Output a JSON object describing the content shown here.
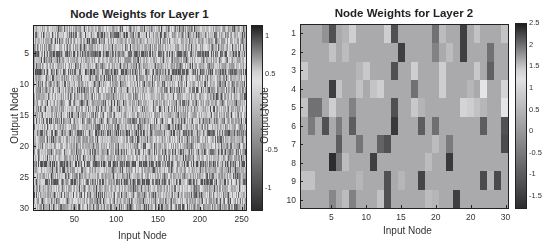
{
  "chart_data": [
    {
      "type": "heatmap",
      "title": "Node Weights for Layer 1",
      "xlabel": "Input Node",
      "ylabel": "Output Node",
      "x_range": [
        1,
        256
      ],
      "y_range": [
        1,
        30
      ],
      "xticks": [
        50,
        100,
        150,
        200,
        250
      ],
      "yticks": [
        5,
        10,
        15,
        20,
        25,
        30
      ],
      "colorbar": {
        "ticks": [
          1,
          0.5,
          0,
          -0.5,
          -1
        ],
        "range": [
          -1.3,
          1.15
        ],
        "colormap": "gray-tinted (dark = high/low extremes, light = ~0.5)"
      },
      "rows": 30,
      "cols": 256,
      "row_character": {
        "dark_rows": [
          5,
          8,
          18,
          23,
          26
        ],
        "medium_rows": [
          2,
          11,
          14,
          16,
          21,
          28,
          30
        ],
        "note": "Individual 30x256 weights not legible; rows 5 and 23 show strong dark banding, rows 8, 18, 26 moderate banding."
      }
    },
    {
      "type": "heatmap",
      "title": "Node Weights for Layer 2",
      "xlabel": "Input Node",
      "ylabel": "Output Node",
      "x_range": [
        1,
        30
      ],
      "y_range": [
        1,
        10
      ],
      "xticks": [
        "5",
        "10",
        "15",
        "20",
        "20",
        "30"
      ],
      "yticks": [
        1,
        2,
        3,
        4,
        5,
        6,
        7,
        8,
        9,
        10
      ],
      "colorbar": {
        "ticks": [
          2.5,
          2,
          1.5,
          1,
          0.5,
          0,
          -0.5,
          -1,
          -1.5
        ],
        "range": [
          -1.8,
          2.5
        ]
      },
      "rows": 10,
      "cols": 30,
      "values": [
        [
          0.3,
          0.3,
          0.3,
          1.8,
          2.2,
          0.3,
          1.6,
          0.9,
          0.3,
          0.3,
          0.3,
          0.3,
          0.9,
          2.2,
          0.3,
          0.3,
          0.3,
          0.3,
          0.3,
          2.0,
          0.6,
          0.3,
          0.3,
          2.3,
          0.3,
          0.7,
          0.3,
          0.3,
          0.3,
          1.5
        ],
        [
          0.3,
          0.3,
          0.3,
          0.3,
          0.7,
          0.3,
          0.6,
          0.3,
          0.3,
          0.3,
          0.3,
          0.3,
          0.3,
          0.3,
          2.3,
          0.3,
          0.3,
          0.3,
          0.3,
          1.9,
          0.3,
          0.6,
          0.3,
          2.3,
          0.3,
          0.3,
          0.3,
          2.0,
          0.3,
          0.3
        ],
        [
          0.8,
          0.3,
          0.3,
          0.3,
          0.3,
          0.3,
          0.3,
          0.3,
          0.5,
          0.8,
          0.3,
          0.3,
          0.3,
          2.2,
          0.3,
          0.3,
          0.9,
          0.3,
          0.3,
          0.3,
          0.9,
          0.3,
          0.3,
          0.3,
          0.3,
          0.8,
          0.3,
          2.1,
          0.3,
          0.3
        ],
        [
          0.3,
          0.3,
          0.3,
          0.3,
          2.3,
          1.5,
          0.3,
          0.3,
          0.7,
          0.3,
          1.5,
          0.9,
          0.3,
          0.3,
          0.3,
          0.3,
          2.0,
          0.3,
          0.3,
          0.3,
          0.9,
          0.3,
          0.3,
          0.3,
          0.5,
          0.3,
          1.3,
          0.3,
          0.3,
          1.0
        ],
        [
          0.7,
          2.0,
          2.0,
          0.3,
          0.9,
          0.3,
          0.3,
          1.9,
          0.3,
          0.3,
          0.3,
          0.3,
          0.3,
          2.2,
          0.3,
          0.3,
          0.8,
          1.6,
          0.3,
          0.3,
          0.3,
          0.3,
          0.3,
          1.0,
          0.9,
          0.7,
          0.5,
          0.3,
          0.3,
          1.3
        ],
        [
          0.3,
          -0.5,
          0.3,
          -1.2,
          0.3,
          -0.5,
          0.3,
          -1.0,
          0.3,
          0.3,
          0.3,
          0.3,
          0.3,
          -1.6,
          0.3,
          0.3,
          0.3,
          -1.0,
          0.3,
          -0.7,
          0.3,
          0.3,
          0.3,
          0.3,
          0.3,
          0.3,
          -1.0,
          0.3,
          0.3,
          -1.2
        ],
        [
          0.3,
          0.3,
          0.3,
          0.3,
          0.3,
          -1.0,
          0.3,
          0.3,
          -0.6,
          0.3,
          0.3,
          -0.9,
          -1.2,
          0.3,
          0.3,
          0.3,
          0.3,
          0.3,
          0.3,
          0.6,
          0.3,
          -0.5,
          0.3,
          0.3,
          0.3,
          0.3,
          0.3,
          0.3,
          0.3,
          -1.3
        ],
        [
          0.3,
          0.3,
          0.3,
          0.3,
          -1.8,
          -0.6,
          0.6,
          0.3,
          0.3,
          0.3,
          -1.5,
          0.3,
          0.3,
          0.3,
          0.3,
          0.3,
          0.3,
          0.3,
          0.6,
          0.3,
          0.3,
          -1.6,
          0.3,
          0.3,
          0.3,
          0.3,
          0.3,
          0.3,
          0.3,
          0.3
        ],
        [
          0.7,
          0.7,
          0.3,
          0.3,
          0.3,
          0.3,
          0.3,
          0.3,
          0.5,
          0.3,
          0.3,
          0.3,
          -1.2,
          0.3,
          0.5,
          0.3,
          0.3,
          -1.4,
          0.3,
          0.3,
          0.3,
          0.3,
          0.3,
          0.3,
          0.3,
          0.3,
          -1.3,
          0.5,
          -1.3,
          0.3
        ],
        [
          0.3,
          0.3,
          0.3,
          0.3,
          -0.3,
          0.3,
          0.6,
          -0.4,
          0.3,
          0.3,
          0.3,
          0.7,
          -1.2,
          0.3,
          0.3,
          0.3,
          0.3,
          0.3,
          0.6,
          0.5,
          0.3,
          0.3,
          -1.5,
          0.3,
          0.3,
          0.3,
          0.3,
          0.3,
          0.3,
          0.3
        ]
      ]
    }
  ],
  "left": {
    "title": "Node Weights for Layer 1",
    "xlabel": "Input Node",
    "ylabel": "Output Node",
    "xticks": [
      "50",
      "100",
      "150",
      "200",
      "250"
    ],
    "yticks": [
      "5",
      "10",
      "15",
      "20",
      "25",
      "30"
    ],
    "cbar_ticks": [
      "1",
      "0.5",
      "0",
      "-0.5",
      "-1"
    ]
  },
  "right": {
    "title": "Node Weights for Layer 2",
    "xlabel": "Input Node",
    "ylabel": "Output Node",
    "xticks": [
      "5",
      "10",
      "15",
      "20",
      "20",
      "30"
    ],
    "yticks": [
      "1",
      "2",
      "3",
      "4",
      "5",
      "6",
      "7",
      "8",
      "9",
      "10"
    ],
    "cbar_ticks": [
      "2.5",
      "2",
      "1.5",
      "1",
      "0.5",
      "0",
      "-0.5",
      "-1",
      "-1.5"
    ]
  }
}
